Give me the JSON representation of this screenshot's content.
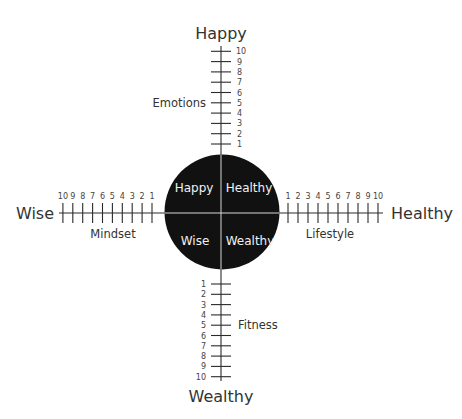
{
  "diagram": {
    "poles": {
      "top": "Happy",
      "bottom": "Wealthy",
      "left": "Wise",
      "right": "Healthy"
    },
    "axes": {
      "top": {
        "name": "Emotions",
        "ticks": [
          "1",
          "2",
          "3",
          "4",
          "5",
          "6",
          "7",
          "8",
          "9",
          "10"
        ]
      },
      "bottom": {
        "name": "Fitness",
        "ticks": [
          "1",
          "2",
          "3",
          "4",
          "5",
          "6",
          "7",
          "8",
          "9",
          "10"
        ]
      },
      "left": {
        "name": "Mindset",
        "ticks": [
          "1",
          "2",
          "3",
          "4",
          "5",
          "6",
          "7",
          "8",
          "9",
          "10"
        ]
      },
      "right": {
        "name": "Lifestyle",
        "ticks": [
          "1",
          "2",
          "3",
          "4",
          "5",
          "6",
          "7",
          "8",
          "9",
          "10"
        ]
      }
    },
    "center_circle": {
      "color": "#111111",
      "quadrants": {
        "top_left": "Happy",
        "top_right": "Healthy",
        "bottom_left": "Wise",
        "bottom_right": "Wealthy"
      }
    }
  }
}
